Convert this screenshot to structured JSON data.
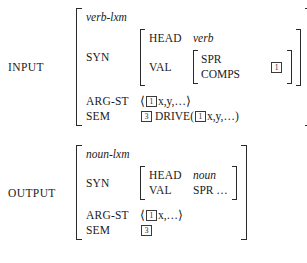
{
  "figure": {
    "kind": "hpsg-lexical-rule"
  },
  "input": {
    "label": "INPUT",
    "type_name": "verb-lxm",
    "syn": {
      "feature": "SYN",
      "head": {
        "feature": "HEAD",
        "value": "verb"
      },
      "val": {
        "feature": "VAL",
        "keys": [
          "SPR",
          "COMPS"
        ],
        "tag": "1"
      }
    },
    "arg_st": {
      "feature": "ARG-ST",
      "open_angle": "⟨",
      "tag": "1",
      "items": "x,y,…",
      "close_angle": "⟩"
    },
    "sem": {
      "feature": "SEM",
      "tag": "3",
      "predicate": "DRIVE(",
      "arg_tag": "1",
      "args": "x,y,…)"
    }
  },
  "output": {
    "label": "OUTPUT",
    "type_name": "noun-lxm",
    "syn": {
      "feature": "SYN",
      "head": {
        "feature": "HEAD",
        "value": "noun"
      },
      "val": {
        "feature": "VAL",
        "value": "SPR …"
      }
    },
    "arg_st": {
      "feature": "ARG-ST",
      "open_angle": "⟨",
      "tag": "1",
      "items": "x,…",
      "close_angle": "⟩"
    },
    "sem": {
      "feature": "SEM",
      "tag": "3"
    }
  },
  "colors": {
    "ink": "#1a1a1a",
    "bracket": "#2a2a2a",
    "background": "#ffffff"
  }
}
